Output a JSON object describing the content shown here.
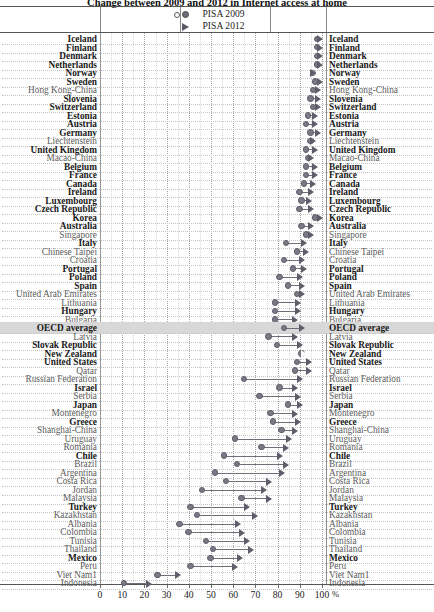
{
  "title": "Change between 2009 and 2012 in Internet access at home",
  "legend": {
    "items": [
      {
        "label": "PISA 2009",
        "glyphs": [
          "open-circle",
          "filled-circle"
        ]
      },
      {
        "label": "PISA 2012",
        "glyphs": [
          "open-triangle",
          "filled-triangle"
        ]
      }
    ]
  },
  "axis": {
    "unit": "%",
    "ticks": [
      0,
      10,
      20,
      30,
      40,
      50,
      60,
      70,
      80,
      90,
      100
    ],
    "tick_labels": [
      "0",
      "10",
      "20",
      "30",
      "40",
      "50",
      "60",
      "70",
      "80",
      "90",
      "100"
    ],
    "min": 0,
    "max": 100
  },
  "highlight_row": "OECD average",
  "footnote_marker": "1",
  "chart_data": {
    "type": "scatter",
    "title": "Change between 2009 and 2012 in Internet access at home",
    "xlabel": "%",
    "ylabel": "",
    "xlim": [
      0,
      100
    ],
    "grid": true,
    "legend_position": "top-center",
    "series": [
      {
        "name": "PISA 2009",
        "marker": "circle"
      },
      {
        "name": "PISA 2012",
        "marker": "triangle"
      }
    ],
    "categories": [
      "Iceland",
      "Finland",
      "Denmark",
      "Netherlands",
      "Norway",
      "Sweden",
      "Hong Kong-China",
      "Slovenia",
      "Switzerland",
      "Estonia",
      "Austria",
      "Germany",
      "Liechtenstein",
      "United Kingdom",
      "Macao-China",
      "Belgium",
      "France",
      "Canada",
      "Ireland",
      "Luxembourg",
      "Czech Republic",
      "Korea",
      "Australia",
      "Singapore",
      "Italy",
      "Chinese Taipei",
      "Croatia",
      "Portugal",
      "Poland",
      "Spain",
      "United Arab Emirates",
      "Lithuania",
      "Hungary",
      "Bulgaria",
      "OECD average",
      "Latvia",
      "Slovak Republic",
      "New Zealand",
      "United States",
      "Qatar",
      "Russian Federation",
      "Israel",
      "Serbia",
      "Japan",
      "Montenegro",
      "Greece",
      "Shanghai-China",
      "Uruguay",
      "Romania",
      "Chile",
      "Brazil",
      "Argentina",
      "Costa Rica",
      "Jordan",
      "Malaysia",
      "Turkey",
      "Kazakhstan",
      "Albania",
      "Colombia",
      "Tunisia",
      "Thailand",
      "Mexico",
      "Peru",
      "Viet Nam",
      "Indonesia"
    ],
    "bold_categories": [
      "Iceland",
      "Finland",
      "Denmark",
      "Netherlands",
      "Norway",
      "Sweden",
      "Slovenia",
      "Switzerland",
      "Estonia",
      "Austria",
      "Germany",
      "United Kingdom",
      "Belgium",
      "France",
      "Canada",
      "Ireland",
      "Luxembourg",
      "Czech Republic",
      "Korea",
      "Australia",
      "Italy",
      "Portugal",
      "Poland",
      "Spain",
      "Hungary",
      "OECD average",
      "Slovak Republic",
      "New Zealand",
      "United States",
      "Israel",
      "Japan",
      "Greece",
      "Chile",
      "Turkey",
      "Mexico"
    ],
    "values_2009": [
      98,
      98,
      98,
      98,
      96,
      97,
      96,
      95,
      96,
      94,
      93,
      95,
      95,
      93,
      94,
      93,
      93,
      92,
      90,
      91,
      90,
      97,
      91,
      93,
      84,
      89,
      83,
      87,
      81,
      85,
      89,
      79,
      79,
      79,
      83,
      76,
      80,
      91,
      89,
      88,
      65,
      81,
      72,
      85,
      77,
      78,
      82,
      61,
      73,
      56,
      62,
      52,
      57,
      46,
      64,
      41,
      44,
      36,
      40,
      48,
      51,
      50,
      41,
      26,
      11
    ],
    "values_2012": [
      99,
      99,
      99,
      99,
      96,
      99,
      98,
      98,
      98,
      97,
      97,
      98,
      96,
      97,
      95,
      97,
      97,
      96,
      95,
      94,
      95,
      99,
      95,
      95,
      92,
      93,
      91,
      92,
      90,
      91,
      91,
      89,
      89,
      88,
      91,
      88,
      90,
      92,
      94,
      94,
      90,
      88,
      89,
      90,
      88,
      89,
      88,
      85,
      84,
      81,
      84,
      82,
      76,
      74,
      76,
      66,
      70,
      62,
      64,
      66,
      68,
      63,
      61,
      35,
      22
    ]
  }
}
